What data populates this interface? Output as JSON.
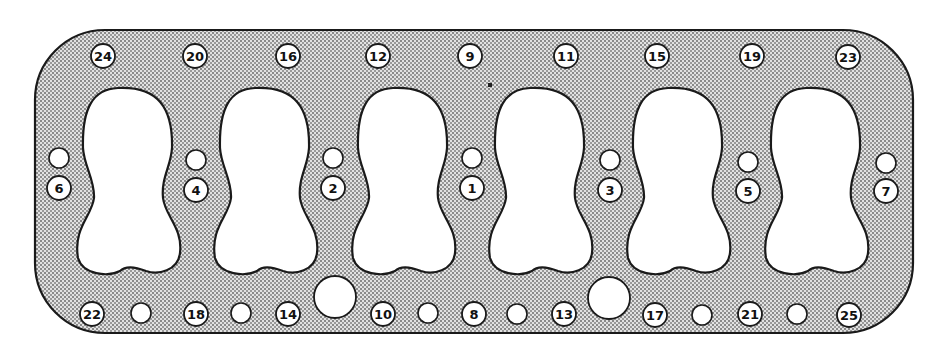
{
  "diagram": {
    "colors": {
      "background": "#ffffff",
      "gasket_fill": "#c9c9c9",
      "outline": "#1a1a1a",
      "hole_fill": "#ffffff"
    },
    "gasket": {
      "x": 35,
      "y": 30,
      "width": 878,
      "height": 303,
      "corner_radius": 70
    },
    "bores": [
      {
        "id": "bore-1",
        "cx": 128
      },
      {
        "id": "bore-2",
        "cx": 265
      },
      {
        "id": "bore-3",
        "cx": 403
      },
      {
        "id": "bore-4",
        "cx": 540
      },
      {
        "id": "bore-5",
        "cx": 678
      },
      {
        "id": "bore-6",
        "cx": 816
      }
    ],
    "bolts_top": [
      {
        "label": "24",
        "x": 103,
        "y": 56
      },
      {
        "label": "20",
        "x": 195,
        "y": 56
      },
      {
        "label": "16",
        "x": 288,
        "y": 56
      },
      {
        "label": "12",
        "x": 378,
        "y": 56
      },
      {
        "label": "9",
        "x": 470,
        "y": 56
      },
      {
        "label": "11",
        "x": 566,
        "y": 56
      },
      {
        "label": "15",
        "x": 657,
        "y": 56
      },
      {
        "label": "19",
        "x": 752,
        "y": 56
      },
      {
        "label": "23",
        "x": 848,
        "y": 57
      }
    ],
    "bolts_middle": [
      {
        "label": "6",
        "x": 59,
        "y": 188,
        "hole_y": 158
      },
      {
        "label": "4",
        "x": 196,
        "y": 190,
        "hole_y": 160
      },
      {
        "label": "2",
        "x": 333,
        "y": 188,
        "hole_y": 158
      },
      {
        "label": "1",
        "x": 472,
        "y": 188,
        "hole_y": 158
      },
      {
        "label": "3",
        "x": 610,
        "y": 190,
        "hole_y": 160
      },
      {
        "label": "5",
        "x": 748,
        "y": 191,
        "hole_y": 162
      },
      {
        "label": "7",
        "x": 886,
        "y": 191,
        "hole_y": 163
      }
    ],
    "bolts_bottom": [
      {
        "label": "22",
        "x": 92,
        "y": 314
      },
      {
        "label": "18",
        "x": 196,
        "y": 314
      },
      {
        "label": "14",
        "x": 288,
        "y": 314
      },
      {
        "label": "10",
        "x": 383,
        "y": 314
      },
      {
        "label": "8",
        "x": 474,
        "y": 314
      },
      {
        "label": "13",
        "x": 564,
        "y": 314
      },
      {
        "label": "17",
        "x": 655,
        "y": 315
      },
      {
        "label": "21",
        "x": 750,
        "y": 314
      },
      {
        "label": "25",
        "x": 849,
        "y": 315
      }
    ],
    "plain_holes_bottom": [
      {
        "x": 141,
        "y": 313,
        "r": 10
      },
      {
        "x": 241,
        "y": 313,
        "r": 10
      },
      {
        "x": 428,
        "y": 313,
        "r": 10
      },
      {
        "x": 517,
        "y": 314,
        "r": 10
      },
      {
        "x": 702,
        "y": 315,
        "r": 10
      },
      {
        "x": 797,
        "y": 314,
        "r": 10
      }
    ],
    "large_holes": [
      {
        "x": 335,
        "y": 297,
        "r": 21
      },
      {
        "x": 609,
        "y": 298,
        "r": 21
      }
    ]
  }
}
